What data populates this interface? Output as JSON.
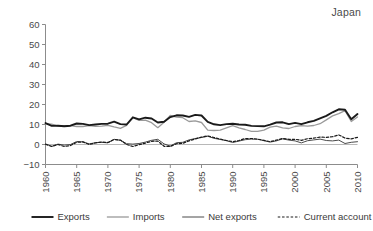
{
  "region_label": "Japan",
  "colors": {
    "exports": "#1a1a1a",
    "imports": "#9a9a9a",
    "net_exports": "#4a4a4a",
    "current_account": "#1a1a1a",
    "axis": "#8c8c8c",
    "text": "#4a4a4a"
  },
  "chart_data": {
    "type": "line",
    "title": "Japan",
    "xlabel": "",
    "ylabel": "",
    "xlim": [
      1960,
      2010
    ],
    "ylim": [
      -10,
      60
    ],
    "ytick_values": [
      -10,
      0,
      10,
      20,
      30,
      40,
      50,
      60
    ],
    "ytick_labels": [
      "−10",
      "0",
      "10",
      "20",
      "30",
      "40",
      "50",
      "60"
    ],
    "xtick_values": [
      1960,
      1965,
      1970,
      1975,
      1980,
      1985,
      1990,
      1995,
      2000,
      2005,
      2010
    ],
    "xtick_labels": [
      "1960",
      "1965",
      "1970",
      "1975",
      "1980",
      "1985",
      "1990",
      "1995",
      "2000",
      "2005",
      "2010"
    ],
    "grid": false,
    "legend_position": "bottom",
    "x": [
      1960,
      1961,
      1962,
      1963,
      1964,
      1965,
      1966,
      1967,
      1968,
      1969,
      1970,
      1971,
      1972,
      1973,
      1974,
      1975,
      1976,
      1977,
      1978,
      1979,
      1980,
      1981,
      1982,
      1983,
      1984,
      1985,
      1986,
      1987,
      1988,
      1989,
      1990,
      1991,
      1992,
      1993,
      1994,
      1995,
      1996,
      1997,
      1998,
      1999,
      2000,
      2001,
      2002,
      2003,
      2004,
      2005,
      2006,
      2007,
      2008,
      2009,
      2010
    ],
    "series": [
      {
        "name": "Exports",
        "style": "solid-thick",
        "color": "#1a1a1a",
        "values": [
          10.7,
          9.3,
          9.4,
          9.1,
          9.4,
          10.5,
          10.3,
          9.7,
          10.0,
          10.3,
          10.4,
          11.4,
          10.2,
          10.0,
          13.6,
          12.6,
          13.4,
          13.0,
          11.0,
          11.4,
          13.7,
          14.6,
          14.5,
          13.8,
          14.8,
          14.5,
          11.3,
          10.1,
          9.7,
          10.2,
          10.4,
          10.0,
          9.9,
          9.3,
          9.2,
          9.1,
          9.9,
          11.0,
          11.1,
          10.2,
          10.8,
          10.2,
          11.1,
          11.8,
          13.1,
          14.3,
          16.1,
          17.6,
          17.4,
          12.6,
          15.2
        ]
      },
      {
        "name": "Imports",
        "style": "solid-medium",
        "color": "#9a9a9a",
        "values": [
          10.4,
          10.2,
          9.2,
          9.4,
          9.4,
          9.0,
          9.0,
          9.4,
          9.1,
          9.2,
          9.6,
          8.8,
          8.1,
          9.6,
          13.4,
          12.1,
          12.2,
          10.9,
          8.4,
          11.1,
          14.5,
          13.7,
          13.4,
          11.5,
          11.8,
          11.0,
          7.2,
          7.0,
          7.2,
          8.3,
          9.4,
          8.3,
          7.5,
          6.6,
          6.6,
          7.2,
          8.7,
          9.2,
          8.3,
          8.0,
          9.0,
          9.4,
          9.2,
          9.5,
          10.4,
          12.3,
          14.3,
          15.4,
          16.9,
          11.5,
          13.8
        ]
      },
      {
        "name": "Net exports",
        "style": "solid-thin",
        "color": "#4a4a4a",
        "values": [
          0.3,
          -0.9,
          0.2,
          -0.3,
          0.0,
          1.5,
          1.3,
          0.3,
          0.9,
          1.1,
          0.8,
          2.6,
          2.1,
          0.4,
          0.2,
          0.5,
          1.2,
          2.1,
          2.6,
          0.3,
          -0.8,
          0.9,
          1.1,
          2.3,
          3.0,
          3.5,
          4.1,
          3.1,
          2.5,
          1.9,
          1.0,
          1.7,
          2.4,
          2.7,
          2.6,
          1.9,
          1.2,
          1.8,
          2.8,
          2.2,
          1.8,
          0.8,
          1.9,
          2.3,
          2.7,
          2.0,
          1.8,
          2.2,
          0.5,
          1.1,
          1.4
        ]
      },
      {
        "name": "Current account",
        "style": "dashed",
        "color": "#1a1a1a",
        "values": [
          0.1,
          -1.0,
          0.0,
          -1.0,
          -0.5,
          1.1,
          1.3,
          0.0,
          0.8,
          1.2,
          1.0,
          2.5,
          2.2,
          0.0,
          -1.0,
          -0.1,
          0.7,
          1.6,
          1.7,
          -0.9,
          -1.0,
          0.4,
          0.6,
          1.8,
          2.8,
          3.7,
          4.3,
          3.5,
          2.7,
          2.0,
          1.4,
          2.0,
          3.0,
          3.0,
          2.7,
          2.1,
          1.4,
          2.2,
          3.0,
          2.6,
          2.6,
          2.1,
          2.9,
          3.2,
          3.7,
          3.6,
          3.9,
          4.8,
          3.2,
          2.8,
          3.6
        ]
      }
    ]
  },
  "legend": {
    "items": [
      {
        "label": "Exports",
        "style": "solid-thick",
        "color": "#1a1a1a"
      },
      {
        "label": "Imports",
        "style": "solid-medium",
        "color": "#9a9a9a"
      },
      {
        "label": "Net exports",
        "style": "solid-thin",
        "color": "#4a4a4a"
      },
      {
        "label": "Current account",
        "style": "dashed",
        "color": "#1a1a1a"
      }
    ]
  }
}
